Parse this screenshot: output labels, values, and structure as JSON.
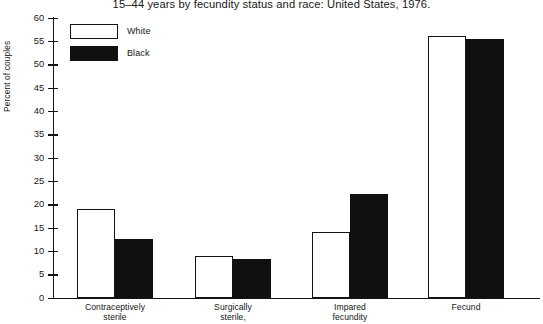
{
  "chart_data": {
    "type": "bar",
    "title": "15–44 years by fecundity status and race: United States, 1976.",
    "xlabel": "",
    "ylabel": "Percent of couples",
    "ylim": [
      0,
      60
    ],
    "ytick_step": 5,
    "yticks": [
      "60",
      "55",
      "50",
      "45",
      "40",
      "35",
      "30",
      "25",
      "20",
      "15",
      "10",
      "5",
      "0"
    ],
    "grid": false,
    "legend_position": "inside-top-left",
    "categories": [
      "Contraceptively sterile",
      "Surgically sterile,",
      "Impared fecundity",
      "Fecund"
    ],
    "category_lines": [
      [
        "Contraceptively",
        "sterile"
      ],
      [
        "Surgically",
        "sterile,"
      ],
      [
        "Impared",
        "fecundity"
      ],
      [
        "Fecund",
        ""
      ]
    ],
    "series": [
      {
        "name": "White",
        "color": "#ffffff",
        "edge_color": "#131313",
        "values": [
          19,
          9,
          14,
          56
        ]
      },
      {
        "name": "Black",
        "color": "#101010",
        "edge_color": "#101010",
        "values": [
          12.5,
          8.3,
          22.3,
          55.5
        ]
      }
    ]
  },
  "legend": {
    "entries": [
      {
        "label": "White",
        "swatch": "white"
      },
      {
        "label": "Black",
        "swatch": "black"
      }
    ]
  }
}
